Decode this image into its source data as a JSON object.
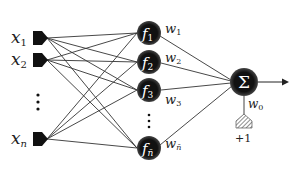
{
  "diagram": {
    "type": "neural-network",
    "inputs": [
      {
        "label": "x",
        "sub": "1",
        "y": 38
      },
      {
        "label": "x",
        "sub": "2",
        "y": 60
      },
      {
        "label": "x",
        "sub": "n",
        "y": 139
      }
    ],
    "input_ellipsis_y": [
      95,
      102,
      109
    ],
    "hidden": [
      {
        "label": "f",
        "sub": "1",
        "y": 33,
        "weight": "w",
        "weight_sub": "1"
      },
      {
        "label": "f",
        "sub": "2",
        "y": 62,
        "weight": "w",
        "weight_sub": "2"
      },
      {
        "label": "f",
        "sub": "3",
        "y": 90,
        "weight": "w",
        "weight_sub": "3"
      },
      {
        "label": "f",
        "sub": "n̄",
        "y": 148,
        "weight": "w",
        "weight_sub": "n̄"
      }
    ],
    "hidden_ellipsis_y": [
      115,
      121,
      127
    ],
    "output": {
      "symbol": "Σ",
      "x": 244,
      "y": 82
    },
    "bias": {
      "weight": "w",
      "weight_sub": "0",
      "value": "+1"
    },
    "colors": {
      "node": "#111111",
      "edge": "#333333",
      "text": "#222222",
      "background": "#ffffff"
    }
  }
}
